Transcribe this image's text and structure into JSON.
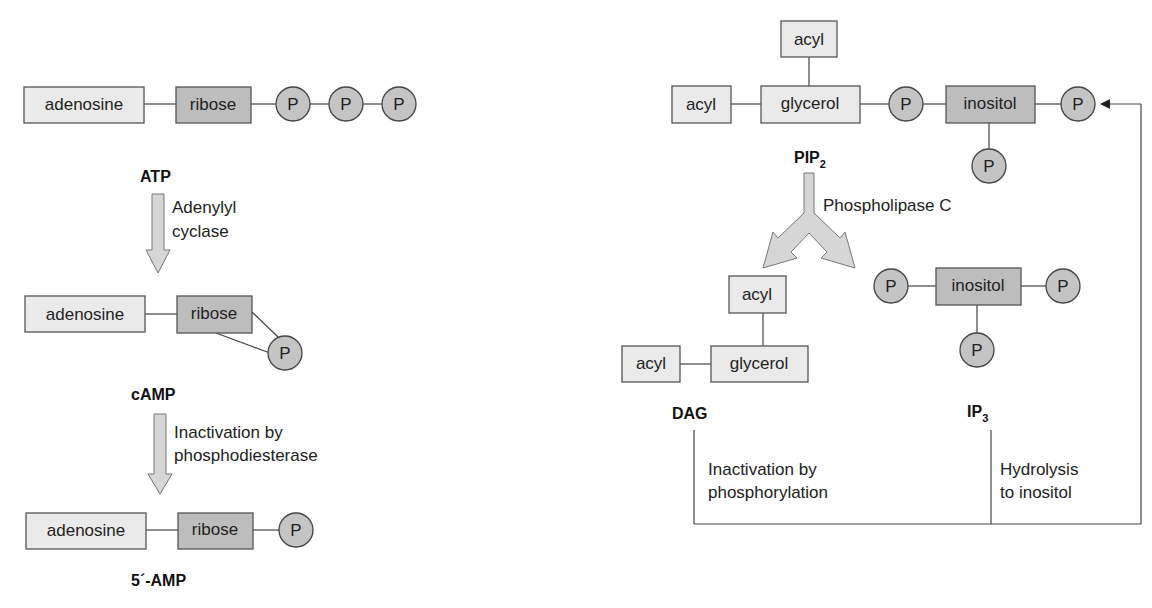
{
  "left_panel": {
    "atp": {
      "boxes": [
        "adenosine",
        "ribose"
      ],
      "phosphates": [
        "P",
        "P",
        "P"
      ],
      "label": "ATP"
    },
    "step1": {
      "line1": "Adenylyl",
      "line2": "cyclase"
    },
    "camp": {
      "boxes": [
        "adenosine",
        "ribose"
      ],
      "phosphates": [
        "P"
      ],
      "label": "cAMP"
    },
    "step2": {
      "line1": "Inactivation by",
      "line2": "phosphodiesterase"
    },
    "amp": {
      "boxes": [
        "adenosine",
        "ribose"
      ],
      "phosphates": [
        "P"
      ],
      "label": "5´-AMP"
    }
  },
  "right_panel": {
    "pip2": {
      "boxes": [
        "acyl",
        "acyl",
        "glycerol",
        "inositol"
      ],
      "phosphates": [
        "P",
        "P",
        "P"
      ],
      "label": "PIP",
      "label_sub": "2"
    },
    "enzyme": "Phospholipase C",
    "dag": {
      "boxes": [
        "acyl",
        "acyl",
        "glycerol"
      ],
      "label": "DAG"
    },
    "ip3": {
      "boxes": [
        "inositol"
      ],
      "phosphates": [
        "P",
        "P",
        "P"
      ],
      "label": "IP",
      "label_sub": "3"
    },
    "dag_fate": {
      "line1": "Inactivation by",
      "line2": "phosphorylation"
    },
    "ip3_fate": {
      "line1": "Hydrolysis",
      "line2": "to inositol"
    }
  }
}
